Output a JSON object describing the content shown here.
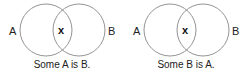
{
  "diagrams": [
    {
      "left_label": "A",
      "right_label": "B",
      "intersection_mark": "x",
      "caption": "Some A is B."
    },
    {
      "left_label": "A",
      "right_label": "B",
      "intersection_mark": "x",
      "caption": "Some B is A."
    }
  ],
  "colors": {
    "circle_stroke": "#888888",
    "text": "#222222"
  }
}
